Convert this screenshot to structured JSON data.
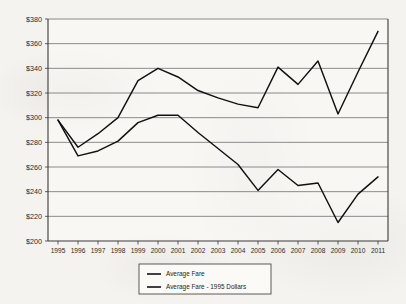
{
  "chart_data": {
    "type": "line",
    "title": "",
    "subtitle": "",
    "xlabel": "",
    "ylabel": "",
    "grid": "horizontal",
    "legend_position": "bottom-center",
    "ylim": [
      200,
      380
    ],
    "ytick_step": 20,
    "ytick_labels": [
      "$380",
      "$360",
      "$340",
      "$320",
      "$300",
      "$280",
      "$260",
      "$240",
      "$220",
      "$200"
    ],
    "ytick_values": [
      380,
      360,
      340,
      320,
      300,
      280,
      260,
      240,
      220,
      200
    ],
    "categories": [
      "1995",
      "1996",
      "1997",
      "1998",
      "1999",
      "2000",
      "2001",
      "2002",
      "2003",
      "2004",
      "2005",
      "2006",
      "2007",
      "2008",
      "2009",
      "2010",
      "2011"
    ],
    "x": [
      1995,
      1996,
      1997,
      1998,
      1999,
      2000,
      2001,
      2002,
      2003,
      2004,
      2005,
      2006,
      2007,
      2008,
      2009,
      2010,
      2011
    ],
    "series": [
      {
        "name": "Average Fare",
        "color": "#111111",
        "values": [
          298,
          276,
          287,
          300,
          330,
          340,
          333,
          322,
          316,
          311,
          308,
          341,
          327,
          346,
          303,
          337,
          370
        ]
      },
      {
        "name": "Average Fare - 1995 Dollars",
        "color": "#111111",
        "values": [
          298,
          269,
          273,
          281,
          296,
          302,
          302,
          288,
          275,
          262,
          241,
          258,
          245,
          247,
          215,
          238,
          252
        ]
      }
    ],
    "legend": [
      {
        "label": "Average Fare"
      },
      {
        "label": "Average Fare - 1995 Dollars"
      }
    ]
  }
}
